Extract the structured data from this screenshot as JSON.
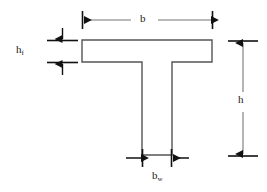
{
  "figure": {
    "type": "t-beam-cross-section",
    "title": "",
    "stroke_color": "#555555",
    "arrow_color": "#111111",
    "fill_color": "#ffffff",
    "background_color": "#ffffff"
  },
  "shape": {
    "name": "tee-section-outline",
    "flange": {
      "x": 82,
      "y": 40,
      "width": 130,
      "height": 22
    },
    "web": {
      "x": 142,
      "y": 62,
      "width": 30,
      "height": 93
    }
  },
  "dimensions": [
    {
      "id": "b",
      "name": "flange-width",
      "label_main": "b",
      "label_sub": "",
      "orientation": "horizontal",
      "from": 82,
      "to": 213,
      "axis_position": 20
    },
    {
      "id": "hf",
      "name": "flange-thickness",
      "label_main": "h",
      "label_sub": "f",
      "orientation": "vertical",
      "from": 40,
      "to": 62,
      "axis_position": 62
    },
    {
      "id": "h",
      "name": "overall-depth",
      "label_main": "h",
      "label_sub": "",
      "orientation": "vertical",
      "from": 41,
      "to": 156,
      "axis_position": 243
    },
    {
      "id": "bw",
      "name": "web-width",
      "label_main": "b",
      "label_sub": "w",
      "orientation": "horizontal",
      "from": 142,
      "to": 172,
      "axis_position": 158
    }
  ]
}
